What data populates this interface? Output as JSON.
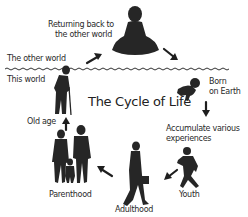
{
  "diagram": {
    "title": "The Cycle of Life",
    "regions": {
      "upper": "The other world",
      "lower": "This world"
    },
    "stages": [
      {
        "id": "returning",
        "label_line1": "Returning back to",
        "label_line2": "the other world",
        "icon": "meditating-figure-icon"
      },
      {
        "id": "born",
        "label_line1": "Born",
        "label_line2": "on Earth",
        "icon": "crawling-baby-icon"
      },
      {
        "id": "experiences",
        "label_line1": "Accumulate various",
        "label_line2": "experiences",
        "icon": "none"
      },
      {
        "id": "youth",
        "label": "Youth",
        "icon": "running-child-icon"
      },
      {
        "id": "adulthood",
        "label": "Adulthood",
        "icon": "walking-businessman-icon"
      },
      {
        "id": "parenthood",
        "label": "Parenthood",
        "icon": "family-icon"
      },
      {
        "id": "oldage",
        "label": "Old age",
        "icon": "elderly-with-cane-icon"
      }
    ],
    "colors": {
      "silhouette": "#262626",
      "background": "#ffffff",
      "text": "#2a2a2a"
    }
  }
}
